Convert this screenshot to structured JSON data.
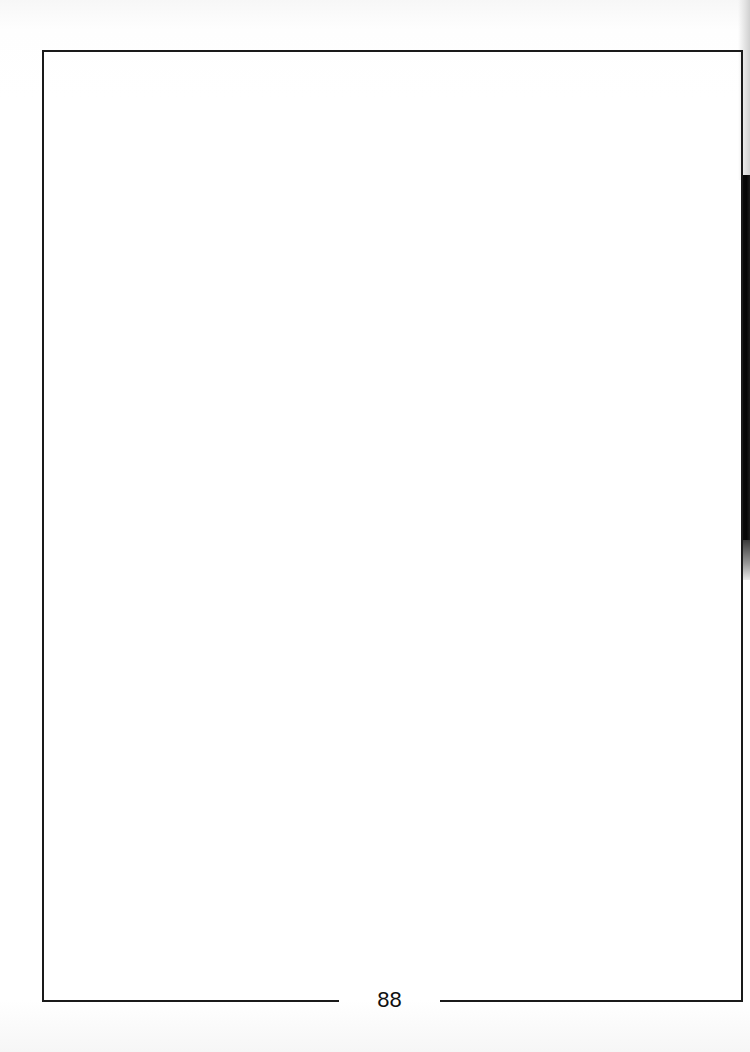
{
  "page": {
    "number": "88",
    "background_color": "#ffffff",
    "border_color": "#1a1a1a"
  },
  "content": {
    "body_text": ""
  }
}
